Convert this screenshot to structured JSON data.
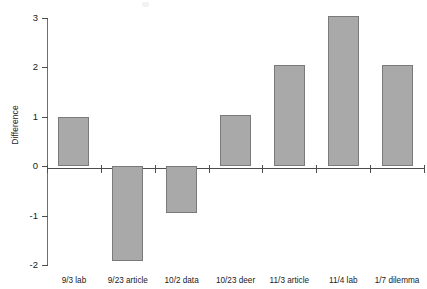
{
  "chart_data": {
    "type": "bar",
    "title": "",
    "subtitle": "",
    "xlabel": "",
    "ylabel": "Difference",
    "categories": [
      "9/3 lab",
      "9/23 article",
      "10/2 data",
      "10/23 deer",
      "11/3 article",
      "11/4 lab",
      "1/7 dilemma"
    ],
    "values": [
      1.0,
      -1.92,
      -0.95,
      1.03,
      2.05,
      3.05,
      2.05
    ],
    "ylim": [
      -2,
      3
    ],
    "yticks": [
      3,
      2,
      1,
      0,
      -1,
      -2
    ],
    "ytick_labels": [
      "3",
      "2",
      "1",
      "0",
      "-1",
      "-2"
    ],
    "grid": false,
    "legend": false,
    "legend_position": "none",
    "bar_color": "#a9a9a9",
    "bar_edge_color": "#7a7a7a",
    "axis_color": "#4d4d4d",
    "background_color": "#ffffff"
  },
  "axes": {
    "y_title": "Difference",
    "ticks": [
      {
        "label": "3",
        "value": 3
      },
      {
        "label": "2",
        "value": 2
      },
      {
        "label": "1",
        "value": 1
      },
      {
        "label": "0",
        "value": 0
      },
      {
        "label": "-1",
        "value": -1
      },
      {
        "label": "-2",
        "value": -2
      }
    ]
  },
  "bars": [
    {
      "label": "9/3 lab",
      "value": 1.0
    },
    {
      "label": "9/23 article",
      "value": -1.92
    },
    {
      "label": "10/2 data",
      "value": -0.95
    },
    {
      "label": "10/23 deer",
      "value": 1.03
    },
    {
      "label": "11/3 article",
      "value": 2.05
    },
    {
      "label": "11/4 lab",
      "value": 3.05
    },
    {
      "label": "1/7 dilemma",
      "value": 2.05
    }
  ]
}
